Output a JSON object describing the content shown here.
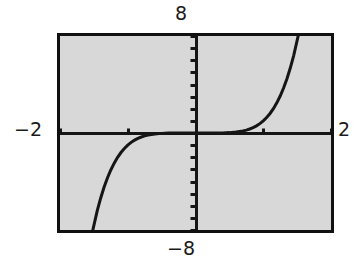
{
  "screen": {
    "title": "graphing-calculator-plot",
    "frame_color": "#111111",
    "screen_color": "#d8d8d8",
    "curve_color": "#151515"
  },
  "labels": {
    "ymax": "8",
    "ymin": "−8",
    "xmin": "−2",
    "xmax": "2"
  },
  "chart_data": {
    "type": "line",
    "title": "",
    "xlabel": "",
    "ylabel": "",
    "xlim": [
      -2,
      2
    ],
    "ylim": [
      -8,
      8
    ],
    "grid": false,
    "legend": "none",
    "axes": {
      "x_axis_at_y": 0,
      "y_axis_at_x": 0,
      "x_tick_step": 1,
      "y_tick_step": 1,
      "x_ticks": [
        -2,
        -1,
        0,
        1,
        2
      ],
      "y_ticks": [
        -8,
        -7,
        -6,
        -5,
        -4,
        -3,
        -2,
        -1,
        0,
        1,
        2,
        3,
        4,
        5,
        6,
        7,
        8
      ]
    },
    "series": [
      {
        "name": "y = x^5",
        "symmetry": "odd",
        "x": [
          -1.52,
          -1.45,
          -1.4,
          -1.35,
          -1.3,
          -1.25,
          -1.2,
          -1.15,
          -1.1,
          -1.05,
          -1.0,
          -0.95,
          -0.9,
          -0.85,
          -0.8,
          -0.75,
          -0.7,
          -0.6,
          -0.5,
          -0.4,
          -0.3,
          -0.2,
          -0.1,
          0.0,
          0.1,
          0.2,
          0.3,
          0.4,
          0.5,
          0.6,
          0.7,
          0.75,
          0.8,
          0.85,
          0.9,
          0.95,
          1.0,
          1.05,
          1.1,
          1.15,
          1.2,
          1.25,
          1.3,
          1.35,
          1.4,
          1.45,
          1.52
        ],
        "y": [
          -8.12,
          -6.41,
          -5.38,
          -4.48,
          -3.71,
          -3.05,
          -2.49,
          -2.01,
          -1.61,
          -1.28,
          -1.0,
          -0.77,
          -0.59,
          -0.44,
          -0.33,
          -0.24,
          -0.17,
          -0.078,
          -0.031,
          -0.01,
          -0.0024,
          -0.00032,
          -1e-05,
          0.0,
          1e-05,
          0.00032,
          0.0024,
          0.01,
          0.031,
          0.078,
          0.17,
          0.24,
          0.33,
          0.44,
          0.59,
          0.77,
          1.0,
          1.28,
          1.61,
          2.01,
          2.49,
          3.05,
          3.71,
          4.48,
          5.38,
          6.41,
          8.12
        ]
      }
    ]
  }
}
